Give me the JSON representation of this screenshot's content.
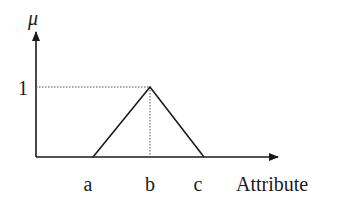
{
  "chart_data": {
    "type": "line",
    "title": "",
    "ylabel": "μ",
    "xlabel": "Attribute",
    "y_tick_labels": [
      "1"
    ],
    "x_tick_labels": [
      "a",
      "b",
      "c"
    ],
    "series": [
      {
        "name": "membership",
        "points": [
          {
            "x": "a",
            "y": 0
          },
          {
            "x": "b",
            "y": 1
          },
          {
            "x": "c",
            "y": 0
          }
        ]
      }
    ],
    "guides": [
      {
        "type": "horizontal-dotted",
        "from": "y-axis",
        "to": "b",
        "y": 1
      },
      {
        "type": "vertical-dotted",
        "x": "b",
        "from": 0,
        "to": 1
      }
    ],
    "ylim": [
      0,
      1
    ]
  }
}
